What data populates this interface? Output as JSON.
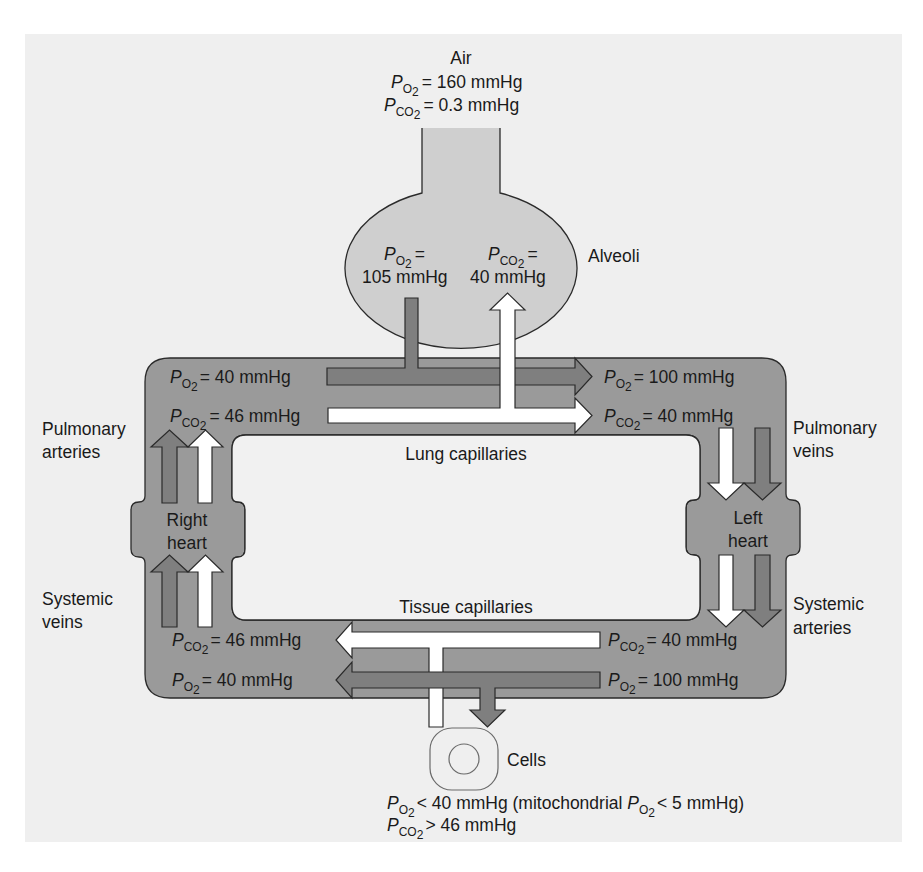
{
  "colors": {
    "panel_background": "#efefef",
    "alveolus_fill": "#cfcfcf",
    "circulation_fill": "#9a9a9a",
    "o2_arrow_fill": "#7f7f7f",
    "co2_arrow_fill": "#ffffff",
    "outline": "#2a2a2a"
  },
  "air": {
    "title": "Air",
    "po2": {
      "symbol": "P",
      "subscript": "O2",
      "sub_main": "O",
      "sub_digit": "2",
      "value": "= 160 mmHg"
    },
    "pco2": {
      "symbol": "P",
      "subscript": "CO2",
      "sub_main": "CO",
      "sub_digit": "2",
      "value": "= 0.3 mmHg"
    }
  },
  "alveoli": {
    "label": "Alveoli",
    "po2": {
      "symbol": "P",
      "sub_main": "O",
      "sub_digit": "2",
      "equals": "=",
      "value": "105 mmHg"
    },
    "pco2": {
      "symbol": "P",
      "sub_main": "CO",
      "sub_digit": "2",
      "equals": "=",
      "value": "40 mmHg"
    }
  },
  "lung_capillaries": {
    "label": "Lung capillaries",
    "inlet_po2": {
      "symbol": "P",
      "sub_main": "O",
      "sub_digit": "2",
      "value": "= 40 mmHg"
    },
    "inlet_pco2": {
      "symbol": "P",
      "sub_main": "CO",
      "sub_digit": "2",
      "value": "= 46 mmHg"
    },
    "outlet_po2": {
      "symbol": "P",
      "sub_main": "O",
      "sub_digit": "2",
      "value": "= 100 mmHg"
    },
    "outlet_pco2": {
      "symbol": "P",
      "sub_main": "CO",
      "sub_digit": "2",
      "value": "= 40 mmHg"
    }
  },
  "tissue_capillaries": {
    "label": "Tissue capillaries",
    "inlet_pco2": {
      "symbol": "P",
      "sub_main": "CO",
      "sub_digit": "2",
      "value": "= 40 mmHg"
    },
    "inlet_po2": {
      "symbol": "P",
      "sub_main": "O",
      "sub_digit": "2",
      "value": "= 100 mmHg"
    },
    "outlet_pco2": {
      "symbol": "P",
      "sub_main": "CO",
      "sub_digit": "2",
      "value": "= 46 mmHg"
    },
    "outlet_po2": {
      "symbol": "P",
      "sub_main": "O",
      "sub_digit": "2",
      "value": "= 40 mmHg"
    }
  },
  "vessels": {
    "pulmonary_arteries": [
      "Pulmonary",
      "arteries"
    ],
    "pulmonary_veins": [
      "Pulmonary",
      "veins"
    ],
    "systemic_veins": [
      "Systemic",
      "veins"
    ],
    "systemic_arteries": [
      "Systemic",
      "arteries"
    ]
  },
  "hearts": {
    "right": [
      "Right",
      "heart"
    ],
    "left": [
      "Left",
      "heart"
    ]
  },
  "cells": {
    "label": "Cells",
    "po2_line": {
      "symbol": "P",
      "sub_main": "O",
      "sub_digit": "2",
      "text1": "< 40 mmHg (mitochondrial ",
      "symbol2": "P",
      "sub2_main": "O",
      "sub2_digit": "2",
      "text2": "< 5 mmHg)"
    },
    "pco2_line": {
      "symbol": "P",
      "sub_main": "CO",
      "sub_digit": "2",
      "value": "> 46 mmHg"
    }
  }
}
